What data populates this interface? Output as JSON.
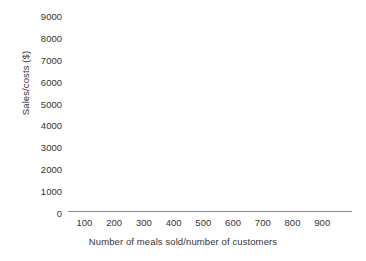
{
  "chart_data": {
    "type": "line",
    "title": "",
    "subtitle": "",
    "xlabel": "Number of meals sold/number of customers",
    "ylabel": "Sales/costs ($)",
    "xlim": [
      0,
      950
    ],
    "ylim": [
      0,
      9500
    ],
    "x_ticks": [
      100,
      200,
      300,
      400,
      500,
      600,
      700,
      800,
      900
    ],
    "x_tick_labels": [
      "100",
      "200",
      "300",
      "400",
      "500",
      "600",
      "700",
      "800",
      "900"
    ],
    "y_ticks": [
      0,
      1000,
      2000,
      3000,
      4000,
      5000,
      6000,
      7000,
      8000,
      9000
    ],
    "y_tick_labels": [
      "0",
      "1000",
      "2000",
      "3000",
      "4000",
      "5000",
      "6000",
      "7000",
      "8000",
      "9000"
    ],
    "series": [],
    "legend": [],
    "legend_position": "none",
    "grid": false,
    "annotations": []
  },
  "style": {
    "background_color": "#ffffff",
    "text_color": "#333333",
    "axis_line_color": "#8a8a8a"
  }
}
